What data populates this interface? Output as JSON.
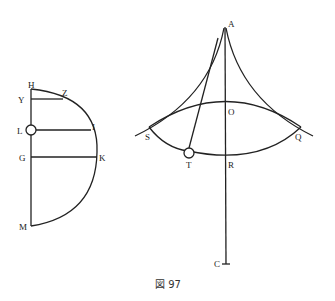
{
  "figure": {
    "caption": "図 97",
    "left_diagram": {
      "labels": {
        "H": "H",
        "Y": "Y",
        "Z": "Z",
        "L": "L",
        "I": "I",
        "G": "G",
        "K": "K",
        "M": "M"
      }
    },
    "right_diagram": {
      "labels": {
        "A": "A",
        "O": "O",
        "S": "S",
        "Q": "Q",
        "T": "T",
        "R": "R",
        "C": "C"
      }
    },
    "colors": {
      "ink": "#222222",
      "background": "#ffffff"
    }
  }
}
